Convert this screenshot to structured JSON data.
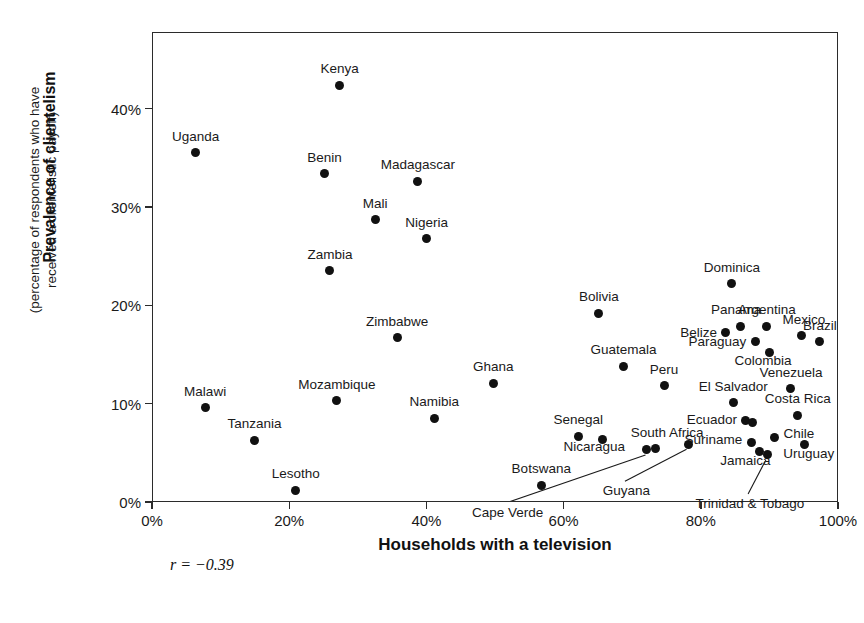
{
  "chart_data": {
    "type": "scatter",
    "title": "",
    "xlabel": "Households with a television",
    "ylabel": "Prevalence of clientelism",
    "ylabel_sub_line1": "(percentage of respondents who have",
    "ylabel_sub_line2": "received a clientelistic payoff)",
    "xlim": [
      0,
      100
    ],
    "ylim": [
      0,
      47.8
    ],
    "grid": false,
    "legend": "none",
    "xticks": [
      "0%",
      "20%",
      "40%",
      "60%",
      "80%",
      "100%"
    ],
    "xtick_values": [
      0,
      20,
      40,
      60,
      80,
      100
    ],
    "yticks": [
      "0%",
      "10%",
      "20%",
      "30%",
      "40%"
    ],
    "ytick_values": [
      0,
      10,
      20,
      30,
      40
    ],
    "annotation": "r = −0.39",
    "correlation": -0.39,
    "marker_color": "#111111",
    "frame_color": "#2b2b2b",
    "points": [
      {
        "label": "Kenya",
        "x": 27.2,
        "y": 42.5,
        "anchor": "center",
        "dx": 0,
        "dy": -10
      },
      {
        "label": "Uganda",
        "x": 6.2,
        "y": 35.6,
        "anchor": "center",
        "dx": 0,
        "dy": -10
      },
      {
        "label": "Benin",
        "x": 25.0,
        "y": 33.5,
        "anchor": "center",
        "dx": 0,
        "dy": -10
      },
      {
        "label": "Madagascar",
        "x": 38.6,
        "y": 32.7,
        "anchor": "center",
        "dx": 0,
        "dy": -10
      },
      {
        "label": "Mali",
        "x": 32.4,
        "y": 28.8,
        "anchor": "center",
        "dx": 0,
        "dy": -10
      },
      {
        "label": "Nigeria",
        "x": 39.9,
        "y": 26.9,
        "anchor": "center",
        "dx": 0,
        "dy": -10
      },
      {
        "label": "Zambia",
        "x": 25.8,
        "y": 23.6,
        "anchor": "center",
        "dx": 0,
        "dy": -10
      },
      {
        "label": "Dominica",
        "x": 84.4,
        "y": 22.3,
        "anchor": "center",
        "dx": 0,
        "dy": -10
      },
      {
        "label": "Bolivia",
        "x": 65.0,
        "y": 19.3,
        "anchor": "center",
        "dx": 0,
        "dy": -10
      },
      {
        "label": "Argentina",
        "x": 89.5,
        "y": 18.0,
        "anchor": "center",
        "dx": 0,
        "dy": -10
      },
      {
        "label": "Panama",
        "x": 85.6,
        "y": 18.0,
        "anchor": "center",
        "dx": -4,
        "dy": -10
      },
      {
        "label": "Belize",
        "x": 83.4,
        "y": 17.3,
        "anchor": "right",
        "dx": -8,
        "dy": 0
      },
      {
        "label": "Mexico",
        "x": 94.6,
        "y": 17.0,
        "anchor": "center",
        "dx": 2,
        "dy": -10
      },
      {
        "label": "Zimbabwe",
        "x": 35.6,
        "y": 16.8,
        "anchor": "center",
        "dx": 0,
        "dy": -10
      },
      {
        "label": "Brazil",
        "x": 97.2,
        "y": 16.4,
        "anchor": "center",
        "dx": 0,
        "dy": -10
      },
      {
        "label": "Paraguay",
        "x": 87.8,
        "y": 16.4,
        "anchor": "right",
        "dx": -9,
        "dy": 0
      },
      {
        "label": "Colombia",
        "x": 89.8,
        "y": 15.3,
        "anchor": "center",
        "dx": -6,
        "dy": 14
      },
      {
        "label": "Guatemala",
        "x": 68.6,
        "y": 13.9,
        "anchor": "center",
        "dx": 0,
        "dy": -10
      },
      {
        "label": "Peru",
        "x": 74.5,
        "y": 11.9,
        "anchor": "center",
        "dx": 0,
        "dy": -10
      },
      {
        "label": "Venezuela",
        "x": 93.0,
        "y": 11.6,
        "anchor": "center",
        "dx": 0,
        "dy": -10
      },
      {
        "label": "Ghana",
        "x": 49.6,
        "y": 12.2,
        "anchor": "center",
        "dx": 0,
        "dy": -10
      },
      {
        "label": "Mozambique",
        "x": 26.8,
        "y": 10.4,
        "anchor": "center",
        "dx": 0,
        "dy": -10
      },
      {
        "label": "El Salvador",
        "x": 84.6,
        "y": 10.2,
        "anchor": "center",
        "dx": 0,
        "dy": -10
      },
      {
        "label": "Malawi",
        "x": 7.6,
        "y": 9.7,
        "anchor": "center",
        "dx": 0,
        "dy": -10
      },
      {
        "label": "Costa Rica",
        "x": 94.0,
        "y": 8.9,
        "anchor": "center",
        "dx": 0,
        "dy": -10
      },
      {
        "label": "Namibia",
        "x": 41.0,
        "y": 8.6,
        "anchor": "center",
        "dx": 0,
        "dy": -10
      },
      {
        "label": "Ecuador",
        "x": 86.3,
        "y": 8.4,
        "anchor": "right",
        "dx": -8,
        "dy": 0
      },
      {
        "label": "Ecuador-b",
        "x": 87.4,
        "y": 8.2,
        "anchor": "none",
        "dx": 0,
        "dy": 0
      },
      {
        "label": "Tanzania",
        "x": 14.8,
        "y": 6.4,
        "anchor": "center",
        "dx": 0,
        "dy": -10
      },
      {
        "label": "Senegal",
        "x": 62.0,
        "y": 6.8,
        "anchor": "center",
        "dx": 0,
        "dy": -10
      },
      {
        "label": "Chile",
        "x": 90.6,
        "y": 6.7,
        "anchor": "left",
        "dx": 9,
        "dy": -3
      },
      {
        "label": "Suriname",
        "x": 87.2,
        "y": 6.2,
        "anchor": "right",
        "dx": -9,
        "dy": -2
      },
      {
        "label": "Nicaragua",
        "x": 65.5,
        "y": 6.5,
        "anchor": "center",
        "dx": -8,
        "dy": 14
      },
      {
        "label": "Uruguay",
        "x": 95.0,
        "y": 5.9,
        "anchor": "center",
        "dx": 4,
        "dy": 15
      },
      {
        "label": "South Africa",
        "x": 73.2,
        "y": 5.5,
        "anchor": "center",
        "dx": 12,
        "dy": -10
      },
      {
        "label": "Cape Verde",
        "x": 72.0,
        "y": 5.4,
        "anchor": "none",
        "dx": 0,
        "dy": 0
      },
      {
        "label": "Guyana",
        "x": 78.0,
        "y": 6.0,
        "anchor": "none",
        "dx": 0,
        "dy": 0
      },
      {
        "label": "Jamaica",
        "x": 88.4,
        "y": 5.2,
        "anchor": "center",
        "dx": -14,
        "dy": 15
      },
      {
        "label": "Trinidad & Tobago",
        "x": 89.6,
        "y": 4.9,
        "anchor": "none",
        "dx": 0,
        "dy": 0
      },
      {
        "label": "Botswana",
        "x": 56.6,
        "y": 1.8,
        "anchor": "center",
        "dx": 0,
        "dy": -10
      },
      {
        "label": "Lesotho",
        "x": 20.8,
        "y": 1.3,
        "anchor": "center",
        "dx": 0,
        "dy": -10
      }
    ],
    "leader_labels": [
      {
        "label": "Cape Verde",
        "lx": 51.7,
        "ly": -1.6,
        "px": 72.0,
        "py": 5.4
      },
      {
        "label": "Guyana",
        "lx": 69.0,
        "ly": 0.6,
        "px": 78.0,
        "py": 6.0
      },
      {
        "label": "Trinidad & Tobago",
        "lx": 87.0,
        "ly": -0.7,
        "px": 89.6,
        "py": 4.9
      }
    ]
  }
}
